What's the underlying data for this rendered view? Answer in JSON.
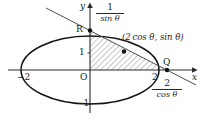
{
  "figure": {
    "kind": "geometry-diagram",
    "axes": {
      "x_label": "x",
      "y_label": "y",
      "origin_label": "O"
    },
    "tick_labels": {
      "x_negative": "−2",
      "x_positive": "2",
      "y_positive": "1",
      "y_negative": "−1"
    },
    "points": [
      {
        "name": "R",
        "label": "R",
        "x_px": 85,
        "y_px": 29
      },
      {
        "name": "tangency",
        "label": "",
        "x_px": 124,
        "y_px": 52
      },
      {
        "name": "Q",
        "label": "Q",
        "x_px": 167,
        "y_px": 70
      }
    ],
    "point_label": "(2 cos θ, sin θ)",
    "y_intercept_value": {
      "numerator": "1",
      "denominator": "sin θ"
    },
    "x_intercept_value": {
      "numerator": "2",
      "denominator": "cos θ"
    },
    "colors": {
      "stroke": "#2a2a2a",
      "curve": "#1a1a1a",
      "hatch": "#555555",
      "background": "#ffffff"
    },
    "ellipse": {
      "cx": 90,
      "cy": 70,
      "rx": 69,
      "ry": 34
    },
    "hatched_region": "triangle bounded by the y-axis, the x-axis and the tangent line"
  }
}
